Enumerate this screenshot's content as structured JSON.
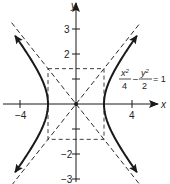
{
  "chart_data": {
    "type": "diagram",
    "title": "",
    "equation": {
      "x_num": "x",
      "x_exp": "2",
      "x_den": "4",
      "minus": "–",
      "y_num": "y",
      "y_exp": "2",
      "y_den": "2",
      "rhs": "= 1"
    },
    "curve": "hyperbola",
    "a": 2,
    "b": 1.4142,
    "asymptotes": [
      "y = x/√2",
      "y = -x/√2"
    ],
    "fundamental_rectangle": {
      "x": [
        -2,
        2
      ],
      "y": [
        -1.4142,
        1.4142
      ]
    },
    "xlabel": "x",
    "ylabel": "y",
    "x_ticks": [
      {
        "value": -4,
        "label": "−4"
      },
      {
        "value": 4,
        "label": "4"
      }
    ],
    "y_ticks": [
      {
        "value": 3,
        "label": "3"
      },
      {
        "value": 2,
        "label": "2"
      },
      {
        "value": 1,
        "label": ""
      },
      {
        "value": -1,
        "label": ""
      },
      {
        "value": -2,
        "label": "−2"
      },
      {
        "value": -3,
        "label": "−3"
      }
    ],
    "xlim": [
      -5.4,
      6.5
    ],
    "ylim": [
      -3.2,
      4.1
    ],
    "grid": false,
    "colors": {
      "curve": "#1a1a1a",
      "axis": "#1a1a1a",
      "dashed": "#2a2a2a"
    }
  }
}
